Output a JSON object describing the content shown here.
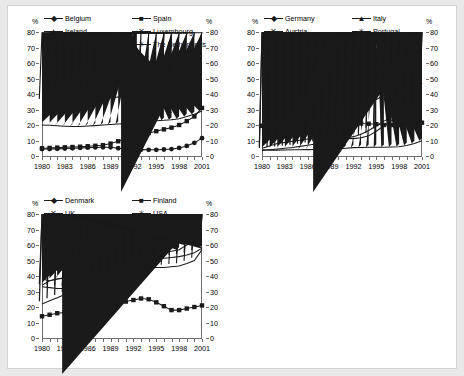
{
  "figure": {
    "panels": [
      {
        "id": "panel-europe-south",
        "axis": {
          "ylabel_left": "%",
          "ylabel_right": "%",
          "yticks": [
            0,
            10,
            20,
            30,
            40,
            50,
            60,
            70,
            80
          ],
          "ylim": [
            0,
            80
          ],
          "xticks": [
            1980,
            1983,
            1986,
            1989,
            1992,
            1995,
            1998,
            2001
          ],
          "xlim": [
            1980,
            2001
          ]
        },
        "legend": [
          {
            "label": "Belgium",
            "marker": "diamond"
          },
          {
            "label": "Spain",
            "marker": "square"
          },
          {
            "label": "Ireland",
            "marker": "triangle"
          },
          {
            "label": "Luxembourg",
            "marker": "cross"
          },
          {
            "label": "Greece",
            "marker": "circle"
          },
          {
            "label": "The Netherlands",
            "marker": "asterisk"
          }
        ]
      },
      {
        "id": "panel-europe-central",
        "axis": {
          "ylabel_left": "%",
          "ylabel_right": "%",
          "yticks": [
            0,
            10,
            20,
            30,
            40,
            50,
            60,
            70,
            80
          ],
          "ylim": [
            0,
            80
          ],
          "xticks": [
            1980,
            1983,
            1986,
            1989,
            1992,
            1995,
            1998,
            2001
          ],
          "xlim": [
            1980,
            2001
          ]
        },
        "legend": [
          {
            "label": "Germany",
            "marker": "diamond"
          },
          {
            "label": "Italy",
            "marker": "triangle"
          },
          {
            "label": "Austria",
            "marker": "cross"
          },
          {
            "label": "Portugal",
            "marker": "asterisk"
          },
          {
            "label": "France",
            "marker": "square"
          }
        ]
      },
      {
        "id": "panel-nordic-anglo",
        "axis": {
          "ylabel_left": "%",
          "ylabel_right": "%",
          "yticks": [
            0,
            10,
            20,
            30,
            40,
            50,
            60,
            70,
            80
          ],
          "ylim": [
            0,
            80
          ],
          "xticks": [
            1980,
            1983,
            1986,
            1989,
            1992,
            1995,
            1998,
            2001
          ],
          "xlim": [
            1980,
            2001
          ]
        },
        "legend": [
          {
            "label": "Denmark",
            "marker": "diamond"
          },
          {
            "label": "Finland",
            "marker": "square"
          },
          {
            "label": "UK",
            "marker": "cross"
          },
          {
            "label": "USA",
            "marker": "asterisk"
          },
          {
            "label": "Sweden",
            "marker": "triangle"
          }
        ]
      }
    ]
  },
  "chart_data": [
    {
      "type": "line",
      "title": "",
      "xlabel": "",
      "ylabel": "%",
      "ylim": [
        0,
        80
      ],
      "grid": false,
      "legend_position": "top",
      "x": [
        1980,
        1981,
        1982,
        1983,
        1984,
        1985,
        1986,
        1987,
        1988,
        1989,
        1990,
        1991,
        1992,
        1993,
        1994,
        1995,
        1996,
        1997,
        1998,
        1999,
        2000,
        2001
      ],
      "series": [
        {
          "name": "Belgium",
          "marker": "diamond",
          "values": [
            20,
            19.8,
            19.5,
            19.2,
            19,
            19,
            19.3,
            19.6,
            20,
            20.3,
            20.6,
            21,
            21.3,
            22,
            22.3,
            22.8,
            23,
            23.4,
            24,
            25.5,
            27,
            29
          ]
        },
        {
          "name": "Spain",
          "marker": "square",
          "values": [
            5,
            5.2,
            5.4,
            5.6,
            5.8,
            6,
            6.3,
            6.6,
            7,
            8,
            9.5,
            11,
            12.3,
            13.5,
            14.8,
            16,
            17.2,
            18.3,
            20,
            22.5,
            25.5,
            31
          ]
        },
        {
          "name": "Ireland",
          "marker": "triangle",
          "values": [
            null,
            null,
            null,
            null,
            null,
            null,
            null,
            null,
            null,
            null,
            null,
            null,
            null,
            null,
            null,
            null,
            null,
            null,
            null,
            null,
            null,
            null
          ]
        },
        {
          "name": "Luxembourg",
          "marker": "cross",
          "values": [
            null,
            null,
            null,
            null,
            null,
            null,
            null,
            null,
            null,
            null,
            null,
            null,
            null,
            null,
            null,
            null,
            31,
            28,
            null,
            null,
            null,
            null
          ]
        },
        {
          "name": "Greece",
          "marker": "circle",
          "values": [
            4.5,
            4.5,
            4.6,
            4.8,
            5,
            5.2,
            5.4,
            5.5,
            5.6,
            5.6,
            5,
            4.6,
            4.3,
            4.1,
            4,
            4,
            4.2,
            4.5,
            5.2,
            6.5,
            8.5,
            11.5
          ]
        },
        {
          "name": "The Netherlands",
          "marker": "asterisk",
          "values": [
            35,
            35.5,
            35.3,
            35,
            34.7,
            34.4,
            34.6,
            35.5,
            36.5,
            37.5,
            38,
            38.2,
            38.5,
            39,
            41,
            44,
            48,
            53,
            59,
            64,
            69,
            73
          ]
        }
      ]
    },
    {
      "type": "line",
      "title": "",
      "xlabel": "",
      "ylabel": "%",
      "ylim": [
        0,
        80
      ],
      "grid": false,
      "legend_position": "top",
      "x": [
        1980,
        1981,
        1982,
        1983,
        1984,
        1985,
        1986,
        1987,
        1988,
        1989,
        1990,
        1991,
        1992,
        1993,
        1994,
        1995,
        1996,
        1997,
        1998,
        1999,
        2000,
        2001
      ],
      "series": [
        {
          "name": "Germany",
          "marker": "diamond",
          "values": [
            33,
            34.5,
            35.5,
            36.3,
            37.5,
            38,
            38.5,
            38,
            37.5,
            36.5,
            36,
            36,
            35,
            32,
            34,
            36.5,
            39,
            40.5,
            42,
            44,
            46.5,
            47
          ]
        },
        {
          "name": "Italy",
          "marker": "triangle",
          "values": [
            4,
            3.8,
            3.8,
            3.9,
            4,
            4,
            4.1,
            4.2,
            4.3,
            4.4,
            4.5,
            5,
            5.4,
            5.5,
            5.6,
            5.7,
            5.7,
            5.8,
            6,
            6.8,
            8,
            9.8
          ]
        },
        {
          "name": "Austria",
          "marker": "cross",
          "values": [
            3.5,
            4,
            4.5,
            5,
            5.5,
            6.2,
            7,
            7.8,
            8.5,
            9.5,
            10.5,
            11.5,
            12.5,
            14,
            16.5,
            19.5,
            22.5,
            25,
            28,
            30,
            30,
            30
          ]
        },
        {
          "name": "Portugal",
          "marker": "asterisk",
          "values": [
            5,
            6.5,
            8,
            8.8,
            9.5,
            10.2,
            11,
            11.5,
            12,
            12.3,
            12,
            11.3,
            11.2,
            11.8,
            13,
            16,
            19.5,
            23,
            26.5,
            31,
            40,
            47
          ]
        },
        {
          "name": "France",
          "marker": "square",
          "values": [
            19.5,
            19.8,
            20,
            20,
            20,
            20.2,
            20.5,
            20.8,
            21,
            21.2,
            21.5,
            21.5,
            21.5,
            21,
            20.8,
            20.5,
            20,
            20,
            20,
            20.5,
            21,
            21.5
          ]
        }
      ]
    },
    {
      "type": "line",
      "title": "",
      "xlabel": "",
      "ylabel": "%",
      "ylim": [
        0,
        80
      ],
      "grid": false,
      "legend_position": "top",
      "x": [
        1980,
        1981,
        1982,
        1983,
        1984,
        1985,
        1986,
        1987,
        1988,
        1989,
        1990,
        1991,
        1992,
        1993,
        1994,
        1995,
        1996,
        1997,
        1998,
        1999,
        2000,
        2001
      ],
      "series": [
        {
          "name": "Denmark",
          "marker": "diamond",
          "values": [
            38,
            37,
            38,
            38.5,
            40,
            43,
            46,
            50,
            53,
            54.5,
            55,
            55.5,
            55.5,
            56,
            56,
            55.5,
            55.5,
            56,
            57,
            60,
            63,
            67
          ]
        },
        {
          "name": "Finland",
          "marker": "square",
          "values": [
            14,
            15,
            16,
            16.5,
            17,
            17.5,
            18,
            19,
            20,
            21,
            22.5,
            23.5,
            24.5,
            25.5,
            25,
            23,
            20.5,
            18,
            18,
            19,
            20,
            21
          ]
        },
        {
          "name": "UK",
          "marker": "cross",
          "values": [
            22,
            24,
            26,
            28,
            30,
            31.5,
            33,
            35,
            37,
            40,
            43,
            45,
            47,
            49,
            50,
            51,
            51.5,
            52,
            52.5,
            53.5,
            55,
            58
          ]
        },
        {
          "name": "USA",
          "marker": "asterisk",
          "values": [
            33,
            32.5,
            32,
            32,
            32.5,
            34,
            36,
            38,
            40,
            42,
            43.5,
            44.5,
            45,
            45,
            45.5,
            45.5,
            45.5,
            46,
            46.5,
            48,
            50,
            57
          ]
        },
        {
          "name": "Sweden",
          "marker": "triangle",
          "values": [
            34,
            37,
            38,
            39,
            43,
            46,
            50,
            53,
            55,
            59,
            64,
            68,
            71,
            72,
            68,
            63,
            63,
            63,
            62,
            61,
            60,
            58
          ]
        }
      ]
    }
  ]
}
